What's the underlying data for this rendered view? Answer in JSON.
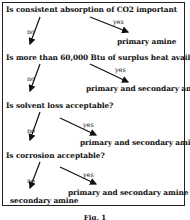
{
  "steps": [
    {
      "question": "Is consistent absorption of CO2 important",
      "yes_label": "yes",
      "no_label": "no",
      "yes_result": "primary amine"
    },
    {
      "question": "Is more than 60,000 Btu of surplus heat available?",
      "yes_label": "yes",
      "no_label": "no",
      "yes_result": "primary and secondary amine"
    },
    {
      "question": "Is solvent loss acceptable?",
      "yes_label": "yes",
      "no_label": "no",
      "yes_result": "primary and secondary amine"
    },
    {
      "question": "Is corrosion acceptable?",
      "yes_label": "yes",
      "no_label": "no",
      "yes_result": "primary and secondary amine"
    }
  ],
  "final_no_result": "secondary amine",
  "caption": "Fig. 1"
}
